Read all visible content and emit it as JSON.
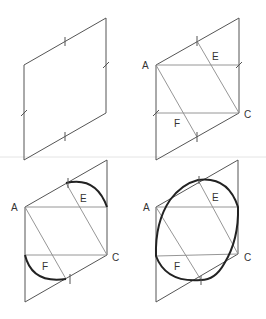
{
  "figure": {
    "colors": {
      "edge": "#555555",
      "construction": "#8a8a8a",
      "curve": "#222222",
      "label": "#333333"
    },
    "panels": [
      {
        "id": "step-1",
        "labels": []
      },
      {
        "id": "step-2",
        "labels": {
          "A": "A",
          "C": "C",
          "E": "E",
          "F": "F"
        }
      },
      {
        "id": "step-3",
        "labels": {
          "A": "A",
          "C": "C",
          "E": "E",
          "F": "F"
        }
      },
      {
        "id": "step-4",
        "labels": {
          "A": "A",
          "C": "C",
          "E": "E",
          "F": "F"
        }
      }
    ]
  }
}
